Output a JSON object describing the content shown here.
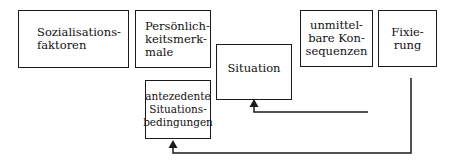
{
  "diagram": {
    "nodes": [
      {
        "id": "sozialisationsfaktoren",
        "label": "Sozialisations-\nfaktoren"
      },
      {
        "id": "persoenlichkeitsmerkmale",
        "label": "Persönlich-\nkeitsmerk-\nmale"
      },
      {
        "id": "situation",
        "label": "Situation"
      },
      {
        "id": "unmittelbare-konsequenzen",
        "label": "unmittel-\nbare Kon-\nsequenzen"
      },
      {
        "id": "fixierung",
        "label": "Fixie-\nrung"
      },
      {
        "id": "antezedente-situationsbedingungen",
        "label": "antezedente\nSituations-\nbedingungen"
      }
    ],
    "edges": [
      {
        "from": "unmittelbare-konsequenzen",
        "to": "situation",
        "style": "feedback-arrow"
      },
      {
        "from": "fixierung",
        "to": "antezedente-situationsbedingungen",
        "style": "feedback-arrow"
      }
    ],
    "colors": {
      "line": "#1a1a1a",
      "background": "#ffffff"
    }
  }
}
